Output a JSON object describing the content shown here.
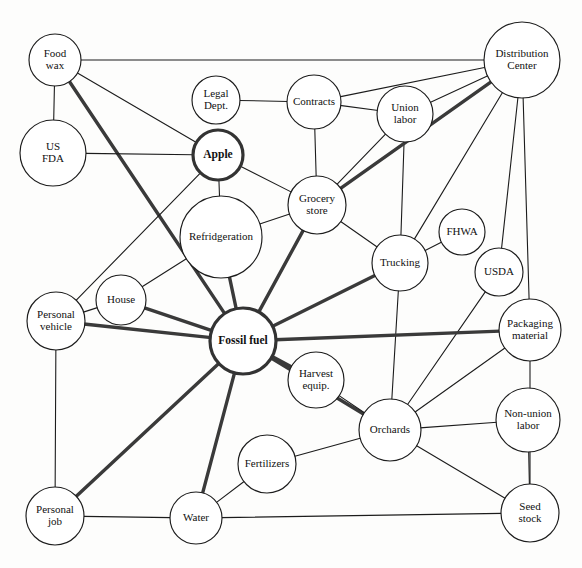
{
  "diagram": {
    "type": "node-link-network",
    "background_color": "#fdfdfc",
    "node_fill": "#ffffff",
    "node_stroke": "#1c1c1c",
    "edge_thin_color": "#1c1c1c",
    "edge_thick_color": "#3a3a3a",
    "caption_partial": "",
    "nodes": [
      {
        "id": "food-wax",
        "label": "Food\nwax",
        "lines": [
          "Food",
          "wax"
        ],
        "cx": 55,
        "cy": 60,
        "r": 26,
        "emphasis": false
      },
      {
        "id": "us-fda",
        "label": "US\nFDA",
        "lines": [
          "US",
          "FDA"
        ],
        "cx": 53,
        "cy": 153,
        "r": 33,
        "emphasis": false
      },
      {
        "id": "legal-dept",
        "label": "Legal\nDept.",
        "lines": [
          "Legal",
          "Dept."
        ],
        "cx": 216,
        "cy": 100,
        "r": 24,
        "emphasis": false
      },
      {
        "id": "contracts",
        "label": "Contracts",
        "lines": [
          "Contracts"
        ],
        "cx": 314,
        "cy": 102,
        "r": 27,
        "emphasis": false
      },
      {
        "id": "union-labor",
        "label": "Union\nlabor",
        "lines": [
          "Union",
          "labor"
        ],
        "cx": 405,
        "cy": 114,
        "r": 28,
        "emphasis": false
      },
      {
        "id": "distribution",
        "label": "Distribution\nCenter",
        "lines": [
          "Distribution",
          "Center"
        ],
        "cx": 522,
        "cy": 60,
        "r": 38,
        "emphasis": false
      },
      {
        "id": "apple",
        "label": "Apple",
        "lines": [
          "Apple"
        ],
        "cx": 218,
        "cy": 155,
        "r": 25,
        "emphasis": true
      },
      {
        "id": "grocery-store",
        "label": "Grocery\nstore",
        "lines": [
          "Grocery",
          "store"
        ],
        "cx": 317,
        "cy": 205,
        "r": 29,
        "emphasis": false
      },
      {
        "id": "refridgeration",
        "label": "Refridgeration",
        "lines": [
          "Refridgeration"
        ],
        "cx": 221,
        "cy": 237,
        "r": 41,
        "emphasis": false
      },
      {
        "id": "trucking",
        "label": "Trucking",
        "lines": [
          "Trucking"
        ],
        "cx": 400,
        "cy": 263,
        "r": 28,
        "emphasis": false
      },
      {
        "id": "fhwa",
        "label": "FHWA",
        "lines": [
          "FHWA"
        ],
        "cx": 462,
        "cy": 232,
        "r": 23,
        "emphasis": false
      },
      {
        "id": "usda",
        "label": "USDA",
        "lines": [
          "USDA"
        ],
        "cx": 499,
        "cy": 272,
        "r": 24,
        "emphasis": false
      },
      {
        "id": "packaging",
        "label": "Packaging\nmaterial",
        "lines": [
          "Packaging",
          "material"
        ],
        "cx": 530,
        "cy": 330,
        "r": 31,
        "emphasis": false
      },
      {
        "id": "house",
        "label": "House",
        "lines": [
          "House"
        ],
        "cx": 121,
        "cy": 300,
        "r": 25,
        "emphasis": false
      },
      {
        "id": "personal-vehicle",
        "label": "Personal\nvehicle",
        "lines": [
          "Personal",
          "vehicle"
        ],
        "cx": 56,
        "cy": 321,
        "r": 29,
        "emphasis": false
      },
      {
        "id": "fossil-fuel",
        "label": "Fossil fuel",
        "lines": [
          "Fossil fuel"
        ],
        "cx": 243,
        "cy": 341,
        "r": 33,
        "emphasis": true
      },
      {
        "id": "harvest-equip",
        "label": "Harvest\nequip.",
        "lines": [
          "Harvest",
          "equip."
        ],
        "cx": 316,
        "cy": 380,
        "r": 28,
        "emphasis": false
      },
      {
        "id": "orchards",
        "label": "Orchards",
        "lines": [
          "Orchards"
        ],
        "cx": 390,
        "cy": 430,
        "r": 31,
        "emphasis": false
      },
      {
        "id": "non-union-labor",
        "label": "Non-union\nlabor",
        "lines": [
          "Non-union",
          "labor"
        ],
        "cx": 528,
        "cy": 420,
        "r": 32,
        "emphasis": false
      },
      {
        "id": "fertilizers",
        "label": "Fertilizers",
        "lines": [
          "Fertilizers"
        ],
        "cx": 267,
        "cy": 464,
        "r": 29,
        "emphasis": false
      },
      {
        "id": "water",
        "label": "Water",
        "lines": [
          "Water"
        ],
        "cx": 196,
        "cy": 518,
        "r": 26,
        "emphasis": false
      },
      {
        "id": "personal-job",
        "label": "Personal\njob",
        "lines": [
          "Personal",
          "job"
        ],
        "cx": 55,
        "cy": 516,
        "r": 29,
        "emphasis": false
      },
      {
        "id": "seed-stock",
        "label": "Seed\nstock",
        "lines": [
          "Seed",
          "stock"
        ],
        "cx": 530,
        "cy": 513,
        "r": 29,
        "emphasis": false
      }
    ],
    "edges": [
      {
        "from": "food-wax",
        "to": "distribution",
        "weight": "thin"
      },
      {
        "from": "food-wax",
        "to": "us-fda",
        "weight": "thin"
      },
      {
        "from": "food-wax",
        "to": "apple",
        "weight": "thin"
      },
      {
        "from": "food-wax",
        "to": "fossil-fuel",
        "weight": "thick"
      },
      {
        "from": "us-fda",
        "to": "apple",
        "weight": "thin"
      },
      {
        "from": "legal-dept",
        "to": "contracts",
        "weight": "thin"
      },
      {
        "from": "contracts",
        "to": "distribution",
        "weight": "thin"
      },
      {
        "from": "contracts",
        "to": "union-labor",
        "weight": "thin"
      },
      {
        "from": "contracts",
        "to": "grocery-store",
        "weight": "thin"
      },
      {
        "from": "union-labor",
        "to": "distribution",
        "weight": "thin"
      },
      {
        "from": "union-labor",
        "to": "grocery-store",
        "weight": "thin"
      },
      {
        "from": "union-labor",
        "to": "trucking",
        "weight": "thin"
      },
      {
        "from": "distribution",
        "to": "grocery-store",
        "weight": "thick"
      },
      {
        "from": "distribution",
        "to": "trucking",
        "weight": "thin"
      },
      {
        "from": "distribution",
        "to": "usda",
        "weight": "thin"
      },
      {
        "from": "distribution",
        "to": "packaging",
        "weight": "thin"
      },
      {
        "from": "apple",
        "to": "refridgeration",
        "weight": "thin"
      },
      {
        "from": "apple",
        "to": "grocery-store",
        "weight": "thin"
      },
      {
        "from": "apple",
        "to": "personal-vehicle",
        "weight": "thin"
      },
      {
        "from": "grocery-store",
        "to": "refridgeration",
        "weight": "thin"
      },
      {
        "from": "grocery-store",
        "to": "trucking",
        "weight": "thin"
      },
      {
        "from": "grocery-store",
        "to": "fossil-fuel",
        "weight": "thick"
      },
      {
        "from": "refridgeration",
        "to": "fossil-fuel",
        "weight": "thick"
      },
      {
        "from": "refridgeration",
        "to": "house",
        "weight": "thin"
      },
      {
        "from": "trucking",
        "to": "fhwa",
        "weight": "thin"
      },
      {
        "from": "trucking",
        "to": "fossil-fuel",
        "weight": "thick"
      },
      {
        "from": "trucking",
        "to": "orchards",
        "weight": "thin"
      },
      {
        "from": "usda",
        "to": "orchards",
        "weight": "thin"
      },
      {
        "from": "packaging",
        "to": "fossil-fuel",
        "weight": "thick"
      },
      {
        "from": "packaging",
        "to": "orchards",
        "weight": "thin"
      },
      {
        "from": "packaging",
        "to": "seed-stock",
        "weight": "thin"
      },
      {
        "from": "house",
        "to": "personal-vehicle",
        "weight": "thin"
      },
      {
        "from": "house",
        "to": "fossil-fuel",
        "weight": "thick"
      },
      {
        "from": "personal-vehicle",
        "to": "fossil-fuel",
        "weight": "thick"
      },
      {
        "from": "personal-vehicle",
        "to": "personal-job",
        "weight": "thin"
      },
      {
        "from": "fossil-fuel",
        "to": "harvest-equip",
        "weight": "thick"
      },
      {
        "from": "fossil-fuel",
        "to": "orchards",
        "weight": "thick"
      },
      {
        "from": "fossil-fuel",
        "to": "water",
        "weight": "thick"
      },
      {
        "from": "fossil-fuel",
        "to": "personal-job",
        "weight": "thick"
      },
      {
        "from": "harvest-equip",
        "to": "orchards",
        "weight": "thin"
      },
      {
        "from": "orchards",
        "to": "fertilizers",
        "weight": "thin"
      },
      {
        "from": "orchards",
        "to": "non-union-labor",
        "weight": "thin"
      },
      {
        "from": "orchards",
        "to": "seed-stock",
        "weight": "thin"
      },
      {
        "from": "non-union-labor",
        "to": "seed-stock",
        "weight": "thin"
      },
      {
        "from": "fertilizers",
        "to": "water",
        "weight": "thin"
      },
      {
        "from": "water",
        "to": "personal-job",
        "weight": "thin"
      },
      {
        "from": "water",
        "to": "seed-stock",
        "weight": "thin"
      }
    ]
  }
}
